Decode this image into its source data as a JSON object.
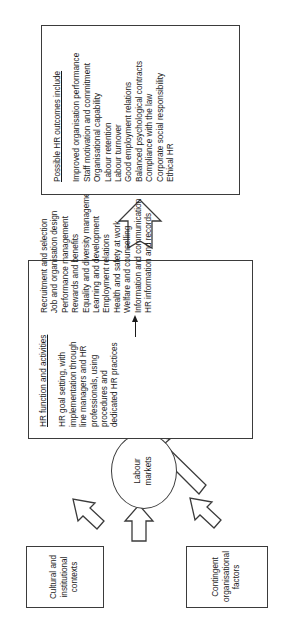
{
  "diagram": {
    "type": "flow-diagram",
    "orientation": "rotated-90-ccw",
    "outcomes_box": {
      "title": "Possible HR outcomes include",
      "items": [
        "Improved organisation performance",
        "Staff motivation and commitment",
        "Organisational capability",
        "Labour retention",
        "Labour turnover",
        "Good employment relations",
        "Balanced psychological contracts",
        "Compliance with the law",
        "Corporate social responsibility",
        "Ethical HR"
      ]
    },
    "hr_function_box": {
      "title": "HR function and activities",
      "description": "HR goal setting, with implementation through line managers and HR professionals, using procedures and dedicated HR practices",
      "practices": [
        "Recruitment and selection",
        "Job and organisation design",
        "Performance management",
        "Rewards and benefits",
        "Equality and diversity management",
        "Learning and development",
        "Employment relations",
        "Health and safety at work",
        "Welfare and counselling",
        "Information and communication",
        "HR information and records"
      ]
    },
    "cultural_box": {
      "label": "Cultural and\ninstitutional\ncontexts"
    },
    "contingent_box": {
      "label": "Contingent\norganisational\nfactors"
    },
    "labour_markets": {
      "label": "Labour\nmarkets"
    },
    "connectors": [
      {
        "name": "cultural-to-labour-markets",
        "style": "hollow-block-arrow"
      },
      {
        "name": "cultural-to-hr-function",
        "style": "hollow-block-arrow"
      },
      {
        "name": "contingent-to-labour-markets",
        "style": "hollow-block-arrow"
      },
      {
        "name": "contingent-to-hr-function",
        "style": "hollow-block-arrow"
      },
      {
        "name": "labour-markets-to-hr-function",
        "style": "hollow-block-arrow"
      },
      {
        "name": "hr-function-to-outcomes",
        "style": "hollow-block-arrow"
      },
      {
        "name": "hr-description-to-practices",
        "style": "thin-line-arrow"
      }
    ],
    "colors": {
      "stroke": "#3b3b3b",
      "text": "#1a1a1a",
      "background": "#ffffff"
    }
  }
}
